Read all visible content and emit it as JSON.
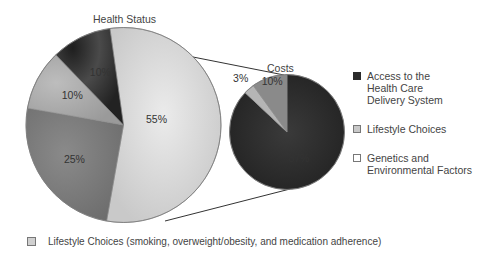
{
  "chart_data": [
    {
      "type": "pie",
      "title": "Health Status",
      "slices": [
        {
          "label": "Genetics and Environmental Factors",
          "value": 55,
          "text": "55%",
          "color": "#d6d6d6"
        },
        {
          "label": "Other (25%)",
          "value": 25,
          "text": "25%",
          "color": "#7a7a7a"
        },
        {
          "label": "Lifestyle Choices",
          "value": 10,
          "text": "10%",
          "color": "#a9a9a9"
        },
        {
          "label": "Access to the Health Care Delivery System",
          "value": 10,
          "text": "10%",
          "color": "#3a3a3a"
        }
      ]
    },
    {
      "type": "pie",
      "title": "Costs",
      "slices": [
        {
          "label": "Access to the Health Care Delivery System",
          "value": 87,
          "text": "87%",
          "color": "#2b2b2b"
        },
        {
          "label": "Lifestyle Choices",
          "value": 3,
          "text": "3%",
          "color": "#b5b5b5"
        },
        {
          "label": "Genetics and Environmental Factors",
          "value": 10,
          "text": "10%",
          "color": "#8a8a8a"
        }
      ]
    }
  ],
  "titles": {
    "left": "Health Status",
    "right": "Costs"
  },
  "labels": {
    "big": [
      "55%",
      "25%",
      "10%",
      "10%"
    ],
    "small": [
      "87%",
      "3%",
      "10%"
    ]
  },
  "legend": [
    {
      "label": "Access to the Health Care Delivery System",
      "color": "#2b2b2b"
    },
    {
      "label": "Lifestyle Choices",
      "color": "#c8c8c8"
    },
    {
      "label": "Genetics and Environmental Factors",
      "color": "#ffffff"
    }
  ],
  "legend_lines": {
    "item0": [
      "Access to the",
      "Health Care",
      "Delivery System"
    ],
    "item1": [
      "Lifestyle Choices"
    ],
    "item2": [
      "Genetics and",
      "Environmental Factors"
    ]
  },
  "footnote": {
    "text": "Lifestyle Choices (smoking, overweight/obesity, and medication adherence)",
    "color": "#c8c8c8"
  }
}
